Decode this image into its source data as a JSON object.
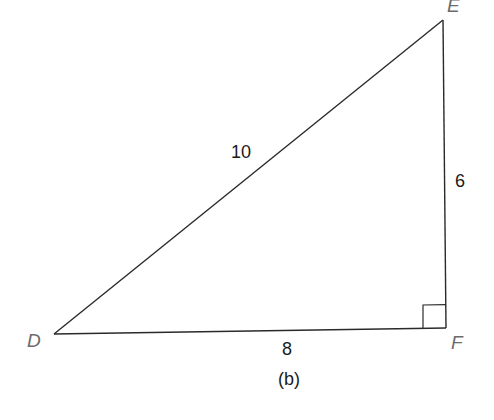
{
  "figure": {
    "caption": "(b)",
    "shape": "right triangle",
    "vertices": {
      "D": {
        "label": "D"
      },
      "E": {
        "label": "E"
      },
      "F": {
        "label": "F"
      }
    },
    "sides": {
      "DE": {
        "label": "10"
      },
      "EF": {
        "label": "6"
      },
      "DF": {
        "label": "8"
      }
    },
    "right_angle_at": "F",
    "colors": {
      "line": "#2a2a2a",
      "vertex_label": "#6b6b6b",
      "side_label": "#1a1a1a"
    }
  }
}
